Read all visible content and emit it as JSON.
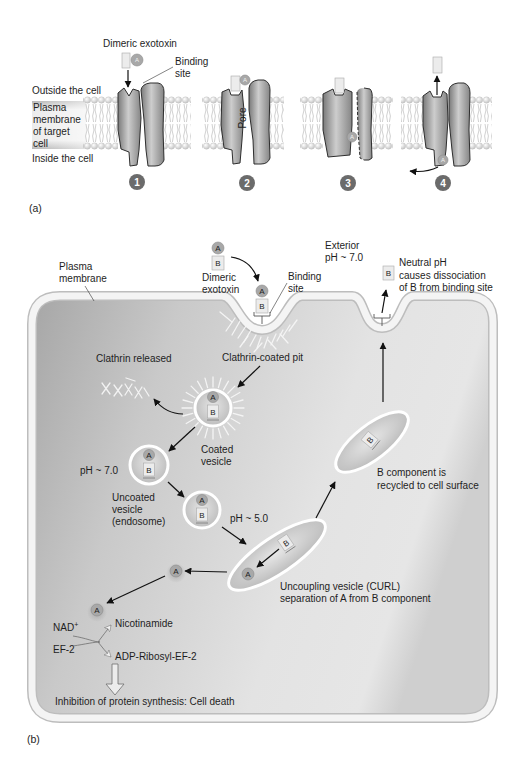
{
  "panel_a": {
    "label": "(a)",
    "toxin_label": "Dimeric exotoxin",
    "binding_site": [
      "Binding",
      "site"
    ],
    "outside": "Outside the cell",
    "membrane": [
      "Plasma",
      "membrane",
      "of target",
      "cell"
    ],
    "inside": "Inside the cell",
    "pore": "Pore",
    "steps": [
      "1",
      "2",
      "3",
      "4"
    ]
  },
  "panel_b": {
    "label": "(b)",
    "plasma_membrane": [
      "Plasma",
      "membrane"
    ],
    "toxin_label": [
      "Dimeric",
      "exotoxin"
    ],
    "binding_site": [
      "Binding",
      "site"
    ],
    "exterior": [
      "Exterior",
      "pH ~ 7.0"
    ],
    "neutral_ph": [
      "Neutral pH",
      "causes dissociation",
      "of B from binding site"
    ],
    "clathrin_coated_pit": "Clathrin-coated pit",
    "clathrin_released": "Clathrin released",
    "coated_vesicle": [
      "Coated",
      "vesicle"
    ],
    "ph_7": "pH ~ 7.0",
    "uncoated_vesicle": [
      "Uncoated",
      "vesicle",
      "(endosome)"
    ],
    "ph_5": "pH ~ 5.0",
    "curl": [
      "Uncoupling vesicle (CURL)",
      "separation of A from B component"
    ],
    "b_recycled": [
      "B component is",
      "recycled to cell surface"
    ],
    "nad": "NAD",
    "nad_sup": "+",
    "ef2": "EF-2",
    "nicotinamide": "Nicotinamide",
    "adp_ribosyl": "ADP-Ribosyl-EF-2",
    "outcome": "Inhibition of protein synthesis: Cell death"
  },
  "components": {
    "a": "A",
    "b": "B"
  },
  "colors": {
    "step_badge": "#6b6b6b",
    "membrane_band": "#bdbdbd",
    "membrane_core": "#f4f4f4",
    "text": "#1e1e1e"
  }
}
